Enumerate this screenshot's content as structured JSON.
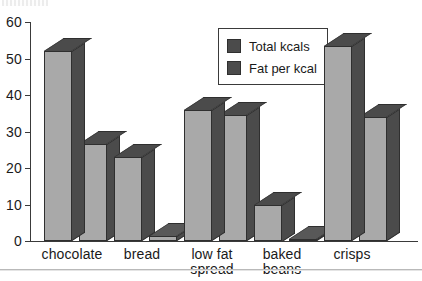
{
  "chart_data": {
    "type": "bar",
    "title": "",
    "xlabel": "",
    "ylabel": "",
    "ylim": [
      0,
      60
    ],
    "yticks": [
      0,
      10,
      20,
      30,
      40,
      50,
      60
    ],
    "grid": false,
    "legend_position": "upper-center-right",
    "style": "3d-bar",
    "categories": [
      "chocolate",
      "bread",
      "low fat\nspread",
      "baked\nbeans",
      "crisps"
    ],
    "series": [
      {
        "name": "Total kcals",
        "values": [
          52,
          23,
          36,
          10,
          53.5
        ]
      },
      {
        "name": "Fat per kcal",
        "values": [
          26.5,
          1.5,
          34.5,
          0.5,
          34
        ]
      }
    ]
  },
  "legend": {
    "items": [
      {
        "label": "Total kcals",
        "swatch": "#4b4b4b"
      },
      {
        "label": "Fat per kcal",
        "swatch": "#4b4b4b"
      }
    ]
  },
  "colors": {
    "bar_front": "#a9a9a9",
    "bar_shade": "#4b4b4b",
    "bar_outline": "#2f2f2f",
    "axis": "#3a3a3a",
    "background": "#ffffff",
    "text": "#1a1a1a"
  }
}
